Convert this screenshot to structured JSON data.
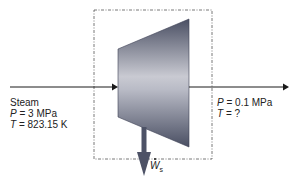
{
  "diagram": {
    "type": "steam-turbine-control-volume",
    "colors": {
      "turbine_dark": "#4a4f63",
      "turbine_light": "#c9cad2",
      "line": "#1a1a1a",
      "dashed_box": "#555555",
      "shaft": "#4d5266"
    },
    "inlet": {
      "fluid": "Steam",
      "pressure_symbol": "P",
      "pressure_value": "= 3 MPa",
      "temperature_symbol": "T",
      "temperature_value": "= 823.15 K"
    },
    "outlet": {
      "pressure_symbol": "P",
      "pressure_value": "= 0.1 MPa",
      "temperature_symbol": "T",
      "temperature_value": "= ?"
    },
    "work": {
      "symbol": "W",
      "subscript": "s"
    }
  }
}
